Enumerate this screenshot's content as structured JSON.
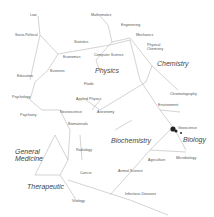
{
  "diagram": {
    "type": "science-map-network",
    "clusters": [
      {
        "label": "Physics",
        "x": 99,
        "y": 70
      },
      {
        "label": "Chemistry",
        "x": 160,
        "y": 63
      },
      {
        "label": "Biology",
        "x": 183,
        "y": 138
      },
      {
        "label": "Biochemistry",
        "x": 111,
        "y": 139
      },
      {
        "label": "General\nMedicine",
        "x": 15,
        "y": 150
      },
      {
        "label": "Therapeutic",
        "x": 27,
        "y": 184
      }
    ],
    "nodes": [
      {
        "label": "Law",
        "x": 30,
        "y": 15
      },
      {
        "label": "Socio-Political",
        "x": 15,
        "y": 35
      },
      {
        "label": "Statistics",
        "x": 74,
        "y": 42
      },
      {
        "label": "Economics",
        "x": 63,
        "y": 57
      },
      {
        "label": "Business",
        "x": 50,
        "y": 71
      },
      {
        "label": "Education",
        "x": 17,
        "y": 76
      },
      {
        "label": "Psychology",
        "x": 12,
        "y": 97
      },
      {
        "label": "Psychiatry",
        "x": 20,
        "y": 115
      },
      {
        "label": "Neuroscience",
        "x": 60,
        "y": 112
      },
      {
        "label": "Biomaterials",
        "x": 68,
        "y": 124
      },
      {
        "label": "Mathematics",
        "x": 91,
        "y": 15
      },
      {
        "label": "Computer Science",
        "x": 94,
        "y": 55
      },
      {
        "label": "Engineering",
        "x": 121,
        "y": 25
      },
      {
        "label": "Mechanics",
        "x": 136,
        "y": 35
      },
      {
        "label": "Physical\nChemistry",
        "x": 147,
        "y": 45
      },
      {
        "label": "Fluids",
        "x": 84,
        "y": 84
      },
      {
        "label": "Applied Physics",
        "x": 76,
        "y": 99
      },
      {
        "label": "Astronomy",
        "x": 97,
        "y": 112
      },
      {
        "label": "Chromatography",
        "x": 170,
        "y": 94
      },
      {
        "label": "Environment",
        "x": 158,
        "y": 105
      },
      {
        "label": "Geoscience",
        "x": 178,
        "y": 128
      },
      {
        "label": "Microbiology",
        "x": 176,
        "y": 158
      },
      {
        "label": "Agriculture",
        "x": 148,
        "y": 160
      },
      {
        "label": "Animal Science",
        "x": 118,
        "y": 171
      },
      {
        "label": "Infectious Diseases",
        "x": 125,
        "y": 194
      },
      {
        "label": "Radiology",
        "x": 76,
        "y": 150
      },
      {
        "label": "Cancer",
        "x": 80,
        "y": 173
      },
      {
        "label": "Virology",
        "x": 72,
        "y": 201
      }
    ]
  }
}
